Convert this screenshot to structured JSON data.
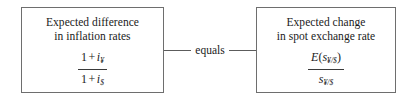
{
  "diagram": {
    "background_color": "#ffffff",
    "border_color": "#6e6e6e",
    "text_color": "#1a1a1a"
  },
  "left_box": {
    "caption_line1": "Expected difference",
    "caption_line2": "in inflation rates",
    "formula": {
      "numerator": {
        "one": "1",
        "plus": "+",
        "variable": "i",
        "subscript": "¥"
      },
      "denominator": {
        "one": "1",
        "plus": "+",
        "variable": "i",
        "subscript": "$"
      }
    }
  },
  "connector": {
    "label": "equals"
  },
  "right_box": {
    "caption_line1": "Expected change",
    "caption_line2": "in spot exchange rate",
    "formula": {
      "numerator": {
        "function": "E",
        "open_paren": "(",
        "variable": "s",
        "subscript": "¥/$",
        "close_paren": ")"
      },
      "denominator": {
        "variable": "s",
        "subscript": "¥/$"
      }
    }
  }
}
